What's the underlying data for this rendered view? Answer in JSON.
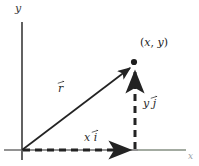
{
  "figure": {
    "name": "vector-components-diagram",
    "background_color": "#ffffff",
    "ink_color": "#2b2b2b",
    "axis_color": "#555555",
    "faint_axis_color": "#9aa0a6"
  },
  "axes": {
    "y_label": "y",
    "x_label": "x",
    "origin": {
      "x": 22,
      "y": 150
    },
    "y_axis_top": {
      "x": 22,
      "y": 22
    },
    "y_axis_bottom": {
      "x": 22,
      "y": 160
    },
    "x_axis_right": {
      "x": 186,
      "y": 150
    }
  },
  "labels": {
    "point": "(x, y)",
    "point_open": "(",
    "point_x": "x",
    "point_comma": ", ",
    "point_y": "y",
    "point_close": ")",
    "resultant": "r",
    "vertical_component": "yĵ",
    "vertical_component_base": "y",
    "vertical_component_unit": "j",
    "horizontal_component": "xî",
    "horizontal_component_base": "x",
    "horizontal_component_unit": "i"
  },
  "vectors": [
    {
      "name": "resultant-vector",
      "label": "r",
      "style": "solid",
      "from": {
        "x": 22,
        "y": 150
      },
      "to": {
        "x": 133,
        "y": 66
      }
    },
    {
      "name": "x-component-vector",
      "label": "xî",
      "style": "dashed",
      "from": {
        "x": 22,
        "y": 150
      },
      "to": {
        "x": 135,
        "y": 150
      }
    },
    {
      "name": "y-component-vector",
      "label": "yĵ",
      "style": "dashed",
      "from": {
        "x": 135,
        "y": 150
      },
      "to": {
        "x": 135,
        "y": 64
      }
    }
  ],
  "point_marker": {
    "x": 134,
    "y": 62,
    "radius": 3
  }
}
